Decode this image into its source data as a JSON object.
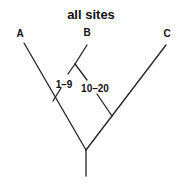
{
  "diagram": {
    "title": "all sites",
    "type": "phylogenetic-tree",
    "taxa": [
      {
        "label": "A"
      },
      {
        "label": "B"
      },
      {
        "label": "C"
      }
    ],
    "branch_labels": [
      {
        "label": "1–9"
      },
      {
        "label": "10–20"
      }
    ],
    "colors": {
      "line": "#222222",
      "text": "#111111",
      "background": "#ffffff"
    }
  }
}
